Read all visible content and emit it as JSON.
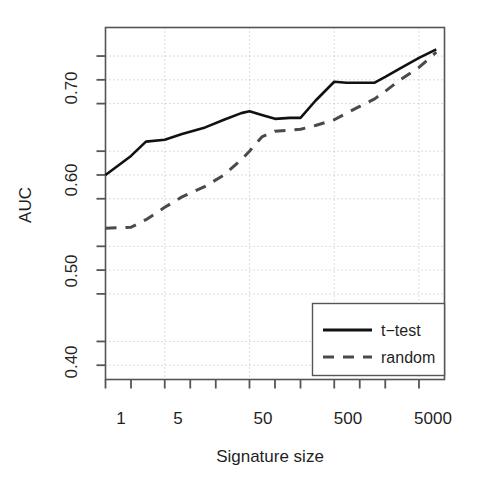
{
  "chart_data": {
    "type": "line",
    "title": "",
    "xlabel": "Signature size",
    "ylabel": "AUC",
    "xscale": "log",
    "xlim": [
      1,
      10000
    ],
    "ylim": [
      0.385,
      0.755
    ],
    "grid": true,
    "grid_style": "dotted",
    "xticks": [
      1,
      5,
      50,
      500,
      5000
    ],
    "xtick_labels": [
      "1",
      "5",
      "50",
      "500",
      "5000"
    ],
    "xminor_ticks": [
      1,
      2,
      5,
      10,
      20,
      50,
      100,
      200,
      500,
      1000,
      2000,
      5000
    ],
    "yticks": [
      0.4,
      0.5,
      0.6,
      0.7
    ],
    "ytick_labels": [
      "0.40",
      "0.50",
      "0.60",
      "0.70"
    ],
    "yminor_ticks": [
      0.425,
      0.475,
      0.525,
      0.575,
      0.625,
      0.675,
      0.725
    ],
    "legend_position": "bottom-right",
    "series": [
      {
        "name": "t-test",
        "label": "t−test",
        "style": "solid",
        "color": "#111111",
        "width": 2.6,
        "x": [
          1,
          2,
          3,
          5,
          8,
          15,
          25,
          40,
          50,
          70,
          100,
          150,
          200,
          300,
          500,
          700,
          1000,
          1500,
          2000,
          3000,
          5000,
          8000
        ],
        "y": [
          0.6,
          0.62,
          0.635,
          0.637,
          0.643,
          0.65,
          0.658,
          0.665,
          0.667,
          0.663,
          0.659,
          0.66,
          0.66,
          0.678,
          0.698,
          0.697,
          0.697,
          0.697,
          0.703,
          0.712,
          0.723,
          0.732
        ]
      },
      {
        "name": "random",
        "label": "random",
        "style": "dashed",
        "color": "#4a4a4a",
        "width": 3.0,
        "x": [
          1,
          2,
          3,
          5,
          8,
          15,
          25,
          40,
          50,
          70,
          100,
          150,
          200,
          300,
          500,
          700,
          1000,
          1500,
          2000,
          3000,
          5000,
          8000
        ],
        "y": [
          0.544,
          0.545,
          0.553,
          0.566,
          0.577,
          0.588,
          0.6,
          0.616,
          0.625,
          0.64,
          0.646,
          0.647,
          0.648,
          0.652,
          0.658,
          0.665,
          0.672,
          0.68,
          0.688,
          0.7,
          0.713,
          0.729
        ]
      }
    ],
    "legend_entries": [
      {
        "label": "t−test",
        "style": "solid"
      },
      {
        "label": "random",
        "style": "dashed"
      }
    ]
  },
  "axes": {
    "y_title": "AUC",
    "x_title": "Signature size"
  },
  "y_labels": [
    "0.70",
    "0.60",
    "0.50",
    "0.40"
  ],
  "x_labels": [
    "1",
    "5",
    "50",
    "500",
    "5000"
  ],
  "legend": {
    "item_1_label": "t−test",
    "item_2_label": "random"
  },
  "colors": {
    "line_primary": "#111111",
    "line_secondary": "#4a4a4a",
    "grid": "#b9b9b9",
    "axis": "#555555",
    "background": "#ffffff"
  }
}
